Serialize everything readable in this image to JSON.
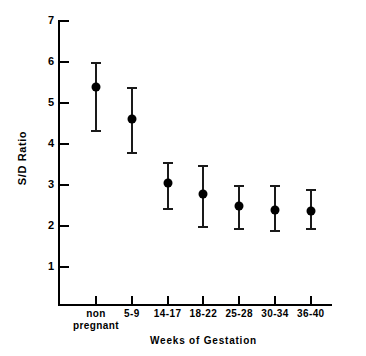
{
  "chart_data": {
    "type": "scatter",
    "title": "",
    "xlabel": "Weeks of Gestation",
    "ylabel": "S/D Ratio",
    "grid": false,
    "legend": "none",
    "ylim": [
      0,
      7
    ],
    "yticks": [
      1,
      2,
      3,
      4,
      5,
      6,
      7
    ],
    "ytick_labels": [
      "1",
      "2",
      "3",
      "4",
      "5",
      "6",
      "7"
    ],
    "categories": [
      "non pregnant",
      "5-9",
      "14-17",
      "18-22",
      "25-28",
      "30-34",
      "36-40"
    ],
    "category_labels": [
      {
        "line1": "non",
        "line2": "pregnant"
      },
      {
        "line1": "5-9",
        "line2": ""
      },
      {
        "line1": "14-17",
        "line2": ""
      },
      {
        "line1": "18-22",
        "line2": ""
      },
      {
        "line1": "25-28",
        "line2": ""
      },
      {
        "line1": "30-34",
        "line2": ""
      },
      {
        "line1": "36-40",
        "line2": ""
      }
    ],
    "values": [
      5.4,
      4.6,
      3.05,
      2.78,
      2.5,
      2.4,
      2.37
    ],
    "err_upper": [
      6.0,
      5.4,
      3.55,
      3.5,
      3.0,
      3.0,
      2.9
    ],
    "err_lower": [
      4.3,
      3.75,
      2.4,
      1.95,
      1.9,
      1.85,
      1.9
    ],
    "series": [
      {
        "name": "S/D Ratio (mean ± SD)",
        "points": [
          {
            "x": "non pregnant",
            "y": 5.4,
            "low": 4.3,
            "high": 6.0
          },
          {
            "x": "5-9",
            "y": 4.6,
            "low": 3.75,
            "high": 5.4
          },
          {
            "x": "14-17",
            "y": 3.05,
            "low": 2.4,
            "high": 3.55
          },
          {
            "x": "18-22",
            "y": 2.78,
            "low": 1.95,
            "high": 3.5
          },
          {
            "x": "25-28",
            "y": 2.5,
            "low": 1.9,
            "high": 3.0
          },
          {
            "x": "30-34",
            "y": 2.4,
            "low": 1.85,
            "high": 3.0
          },
          {
            "x": "36-40",
            "y": 2.37,
            "low": 1.9,
            "high": 2.9
          }
        ]
      }
    ],
    "marker_color": "#000000",
    "axis_color": "#000000",
    "background": "#ffffff"
  }
}
